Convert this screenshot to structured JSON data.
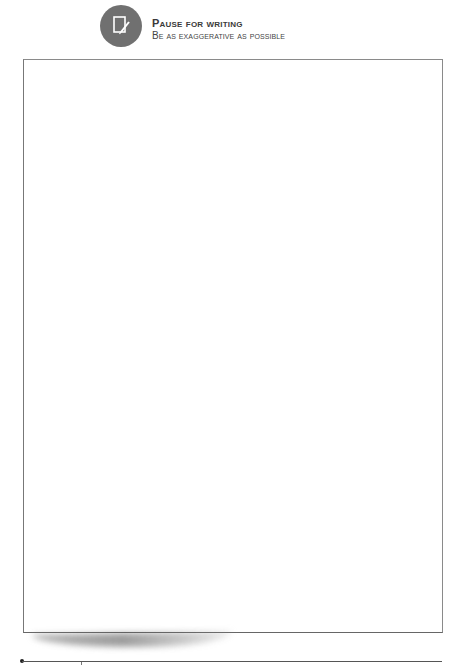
{
  "header": {
    "icon": "pencil-paper-icon",
    "title": "Pause for writing",
    "subtitle": "Be as exaggerative as possible"
  },
  "writing_area": {
    "content": ""
  },
  "colors": {
    "icon_background": "#707070",
    "border": "#8a8a8a",
    "text": "#3a3a3a"
  }
}
